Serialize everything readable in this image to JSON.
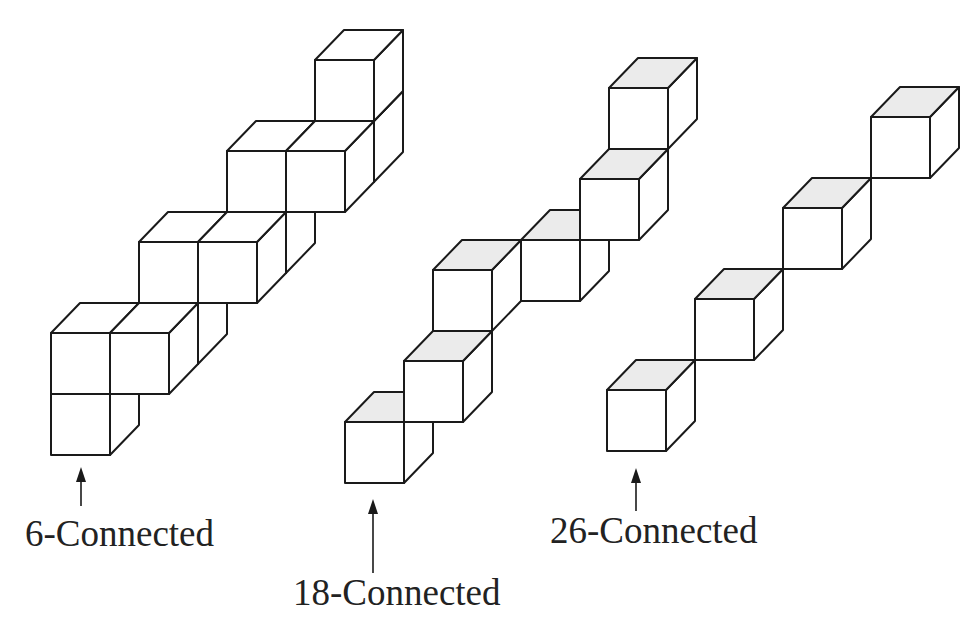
{
  "figure": {
    "background": "#ffffff",
    "stroke_color": "#1a1a1a",
    "shaded_top_color": "#ebebeb",
    "cube": {
      "width": 59,
      "height": 61,
      "depth_dx": 29,
      "depth_dy": -30
    }
  },
  "structures": [
    {
      "id": "six-connected",
      "label": "6-Connected",
      "origin": [
        51,
        394
      ],
      "shaded_tops": false,
      "cubes": [
        [
          0,
          0,
          0
        ],
        [
          0,
          1,
          0
        ],
        [
          1,
          1,
          0
        ],
        [
          1,
          1,
          1
        ],
        [
          1,
          2,
          1
        ],
        [
          2,
          2,
          1
        ],
        [
          2,
          2,
          2
        ],
        [
          2,
          3,
          2
        ],
        [
          3,
          3,
          2
        ],
        [
          3,
          3,
          3
        ],
        [
          3,
          4,
          3
        ]
      ],
      "arrow": {
        "x": 81,
        "y_top": 467,
        "y_bottom": 506
      },
      "label_pos": {
        "x": 25,
        "y": 515
      }
    },
    {
      "id": "eighteen-connected",
      "label": "18-Connected",
      "origin": [
        345,
        422
      ],
      "shaded_tops": true,
      "cubes": [
        [
          0,
          0,
          0
        ],
        [
          1,
          1,
          0
        ],
        [
          1,
          2,
          1
        ],
        [
          2,
          2,
          2
        ],
        [
          3,
          3,
          2
        ],
        [
          3,
          4,
          3
        ]
      ],
      "arrow": {
        "x": 373,
        "y_top": 499,
        "y_bottom": 573
      },
      "label_pos": {
        "x": 293,
        "y": 574
      }
    },
    {
      "id": "twenty-six-connected",
      "label": "26-Connected",
      "origin": [
        607,
        390
      ],
      "shaded_tops": true,
      "cubes": [
        [
          0,
          0,
          0
        ],
        [
          1,
          1,
          1
        ],
        [
          2,
          2,
          2
        ],
        [
          3,
          3,
          3
        ]
      ],
      "arrow": {
        "x": 636,
        "y_top": 468,
        "y_bottom": 511
      },
      "label_pos": {
        "x": 550,
        "y": 512
      }
    }
  ]
}
